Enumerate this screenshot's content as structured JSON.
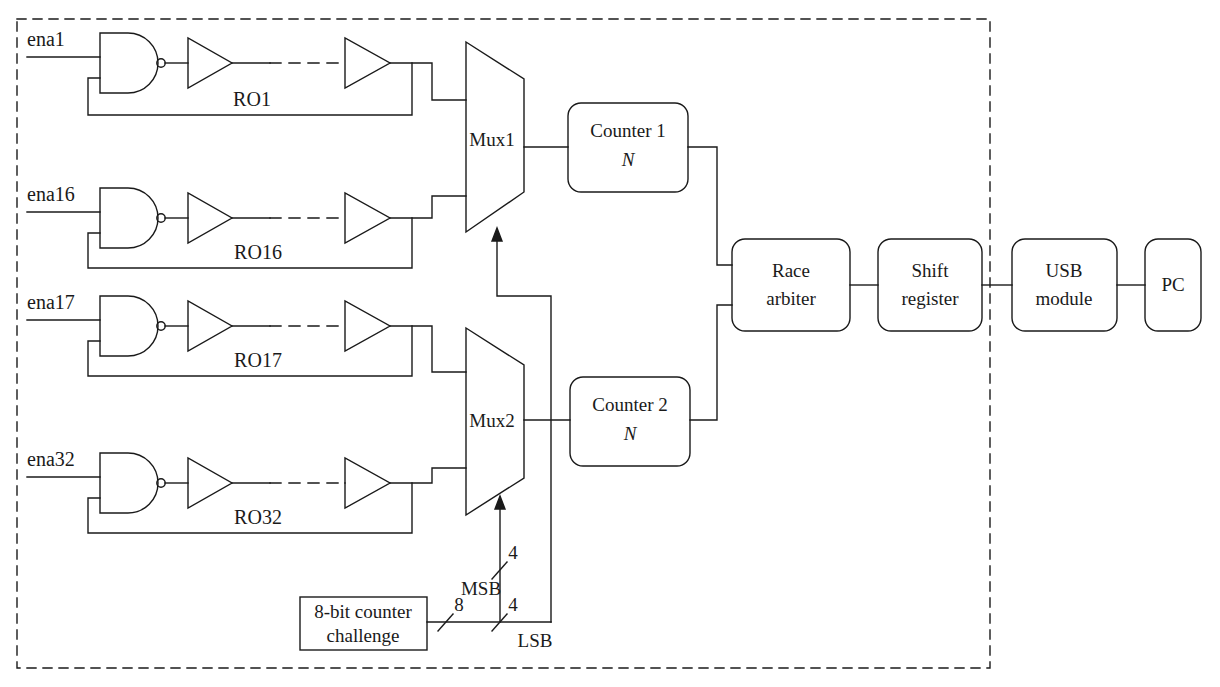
{
  "diagram": {
    "boundary": {
      "style": "dashed",
      "name": "fpga-boundary"
    },
    "stroke_color": "#1a1a1a",
    "background": "#ffffff"
  },
  "inputs": [
    {
      "label": "ena1",
      "ring": "RO1"
    },
    {
      "label": "ena16",
      "ring": "RO16"
    },
    {
      "label": "ena17",
      "ring": "RO17"
    },
    {
      "label": "ena32",
      "ring": "RO32"
    }
  ],
  "rings": [
    {
      "name": "RO1",
      "label": "RO1"
    },
    {
      "name": "RO16",
      "label": "RO16"
    },
    {
      "name": "RO17",
      "label": "RO17"
    },
    {
      "name": "RO32",
      "label": "RO32"
    }
  ],
  "muxes": [
    {
      "name": "mux1",
      "label": "Mux1"
    },
    {
      "name": "mux2",
      "label": "Mux2"
    }
  ],
  "counters": [
    {
      "name": "counter1",
      "label": "Counter 1",
      "sub": "N"
    },
    {
      "name": "counter2",
      "label": "Counter 2",
      "sub": "N"
    }
  ],
  "blocks": [
    {
      "name": "race-arbiter",
      "line1": "Race",
      "line2": "arbiter"
    },
    {
      "name": "shift-register",
      "line1": "Shift",
      "line2": "register"
    },
    {
      "name": "usb-module",
      "line1": "USB",
      "line2": "module"
    },
    {
      "name": "pc",
      "line1": "PC",
      "line2": ""
    }
  ],
  "challenge": {
    "name": "challenge-counter",
    "line1": "8-bit counter",
    "line2": "challenge"
  },
  "bus_labels": {
    "challenge_width": "8",
    "msb_width": "4",
    "lsb_width": "4",
    "msb": "MSB",
    "lsb": "LSB"
  }
}
